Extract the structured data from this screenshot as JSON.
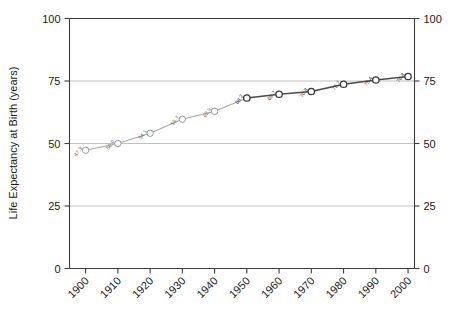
{
  "chart_data": {
    "type": "line",
    "title": "",
    "xlabel": "",
    "ylabel": "Life Expectancy at Birth (years)",
    "xlim": [
      1895,
      2002
    ],
    "ylim": [
      0,
      100
    ],
    "grid": true,
    "legend": false,
    "x_tick_labels": [
      "1900",
      "1910",
      "1920",
      "1930",
      "1940",
      "1950",
      "1960",
      "1970",
      "1980",
      "1990",
      "2000"
    ],
    "x_ticks": [
      1900,
      1910,
      1920,
      1930,
      1940,
      1950,
      1960,
      1970,
      1980,
      1990,
      2000
    ],
    "y_ticks": [
      0,
      25,
      50,
      75,
      100
    ],
    "y_tick_labels": [
      "0",
      "25",
      "50",
      "75",
      "100"
    ],
    "y_tick_labels_right": [
      "0",
      "25",
      "50",
      "75",
      "100"
    ],
    "x": [
      1900,
      1910,
      1920,
      1930,
      1940,
      1950,
      1960,
      1970,
      1980,
      1990,
      2000
    ],
    "values": [
      47.3,
      50.0,
      54.1,
      59.7,
      62.9,
      68.2,
      69.7,
      70.8,
      73.7,
      75.4,
      76.8
    ],
    "point_labels": [
      "47.3",
      "50.0",
      "54.1",
      "59.7",
      "62.9",
      "68.2",
      "69.7",
      "70.8",
      "73.7",
      "75.4",
      "76.8"
    ],
    "series": [
      {
        "name": "Life expectancy at birth",
        "x": [
          1900,
          1910,
          1920,
          1930,
          1940,
          1950,
          1960,
          1970,
          1980,
          1990,
          2000
        ],
        "values": [
          47.3,
          50.0,
          54.1,
          59.7,
          62.9,
          68.2,
          69.7,
          70.8,
          73.7,
          75.4,
          76.8
        ],
        "emphasis_from_index": 5,
        "color_early": "#a8a8a8",
        "color_late": "#4a4a4a"
      }
    ],
    "colors": {
      "axis": "#3c3c3c",
      "grid": "#b9b9b9",
      "line_early": "#a8a8a8",
      "line_late": "#4a4a4a",
      "marker_fill": "#ffffff",
      "background": "#ffffff"
    }
  }
}
